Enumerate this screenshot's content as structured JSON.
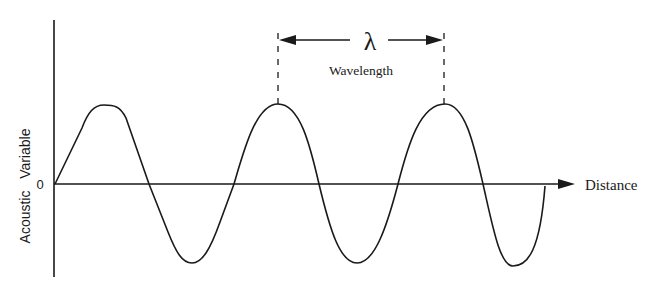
{
  "diagram": {
    "title": "",
    "y_axis_label": "Acoustic   Variable",
    "x_axis_label": "Distance",
    "origin_label": "0",
    "wavelength_symbol": "λ",
    "wavelength_label": "Wavelength",
    "colors": {
      "line": "#1a1a1a",
      "background": "#ffffff"
    }
  }
}
